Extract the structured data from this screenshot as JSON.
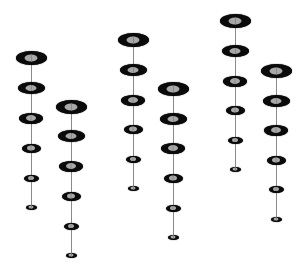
{
  "diagram": {
    "colors": {
      "background": "#ffffff",
      "bead_ring": "#0a0a0a",
      "bead_core": "#a8a8a8",
      "line": "#8a8a8a"
    },
    "bead_sizes": [
      {
        "w": 31,
        "h": 14
      },
      {
        "w": 27,
        "h": 12
      },
      {
        "w": 24,
        "h": 11
      },
      {
        "w": 19,
        "h": 9
      },
      {
        "w": 15,
        "h": 7
      },
      {
        "w": 11,
        "h": 5
      }
    ],
    "strands": [
      {
        "x": 31,
        "ys": [
          58,
          88,
          118,
          148,
          178,
          207
        ]
      },
      {
        "x": 71,
        "ys": [
          107,
          136,
          166,
          196,
          226,
          255
        ]
      },
      {
        "x": 133,
        "ys": [
          40,
          70,
          100,
          129,
          159,
          188
        ]
      },
      {
        "x": 173,
        "ys": [
          89,
          119,
          148,
          178,
          208,
          237
        ]
      },
      {
        "x": 235,
        "ys": [
          21,
          51,
          81,
          110,
          140,
          169
        ]
      },
      {
        "x": 276,
        "ys": [
          71,
          101,
          130,
          160,
          189,
          219
        ]
      }
    ]
  }
}
